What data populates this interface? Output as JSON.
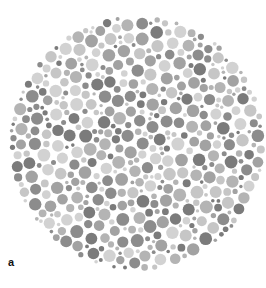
{
  "figure": {
    "panel_label": "a",
    "type": "pseudoisochromatic-dot-plate",
    "plate": {
      "center_x": 137,
      "center_y": 143,
      "radius": 128,
      "dot_colors": [
        "#7b7b7b",
        "#8c8c8c",
        "#a2a2a2",
        "#b4b4b4",
        "#c6c6c6",
        "#d2d2d2"
      ],
      "background": "#ffffff"
    }
  }
}
